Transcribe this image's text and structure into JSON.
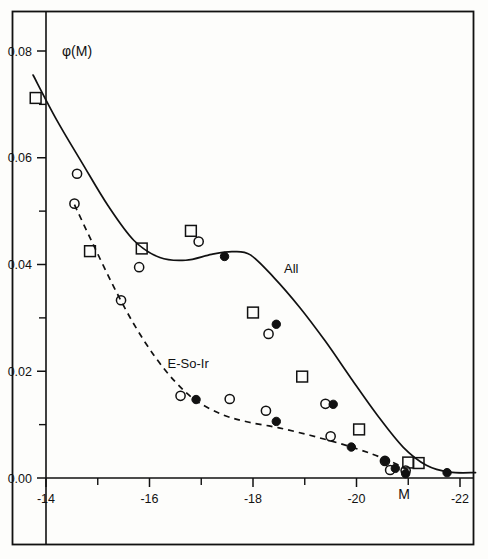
{
  "chart_data": {
    "type": "scatter",
    "title": "",
    "subtitle": "",
    "xlabel": "M",
    "ylabel": "φ(M)",
    "xlim": [
      -13.35,
      -22.35
    ],
    "ylim": [
      0.0,
      0.088
    ],
    "grid": false,
    "legend_position": "inline-annotations",
    "x_ticks_major": [
      "-14",
      "-16",
      "-18",
      "-20",
      "-22"
    ],
    "x_ticks_major_values": [
      -14,
      -16,
      -18,
      -20,
      -22
    ],
    "x_ticks_minor_values": [
      -15,
      -17,
      -19,
      -21
    ],
    "y_ticks_major": [
      "0.08",
      "0.06",
      "0.04",
      "0.02",
      "0.00"
    ],
    "y_ticks_major_values": [
      0.08,
      0.06,
      0.04,
      0.02,
      0.0
    ],
    "y_ticks_minor_values": [
      0.07,
      0.05,
      0.03,
      0.01
    ],
    "annotations": [
      {
        "text": "All",
        "x": -18.6,
        "y": 0.0385,
        "name": "curve-label-all"
      },
      {
        "text": "E-So-Ir",
        "x": -16.35,
        "y": 0.0207,
        "name": "curve-label-e-so-ir"
      }
    ],
    "series": [
      {
        "name": "All",
        "curve_style": "solid",
        "curve_points": [
          [
            -13.75,
            0.0755
          ],
          [
            -14.2,
            0.0672
          ],
          [
            -14.7,
            0.059
          ],
          [
            -15.2,
            0.051
          ],
          [
            -15.7,
            0.0445
          ],
          [
            -16.2,
            0.0413
          ],
          [
            -16.7,
            0.0408
          ],
          [
            -17.2,
            0.0419
          ],
          [
            -17.6,
            0.0424
          ],
          [
            -17.95,
            0.0418
          ],
          [
            -18.4,
            0.0376
          ],
          [
            -18.9,
            0.032
          ],
          [
            -19.4,
            0.0256
          ],
          [
            -19.9,
            0.0186
          ],
          [
            -20.4,
            0.0118
          ],
          [
            -20.9,
            0.0058
          ],
          [
            -21.35,
            0.0024
          ],
          [
            -21.8,
            0.0011
          ],
          [
            -22.3,
            0.001
          ]
        ],
        "points_open_square": [
          [
            -13.8,
            0.0712
          ],
          [
            -14.85,
            0.0425
          ],
          [
            -15.85,
            0.043
          ],
          [
            -16.8,
            0.0463
          ],
          [
            -18.0,
            0.031
          ],
          [
            -18.95,
            0.019
          ],
          [
            -20.05,
            0.0091
          ],
          [
            -21.0,
            0.0029
          ],
          [
            -21.2,
            0.0028
          ]
        ],
        "points_open_circle": [
          [
            -14.6,
            0.057
          ],
          [
            -14.55,
            0.0514
          ],
          [
            -15.8,
            0.0395
          ],
          [
            -16.95,
            0.0443
          ],
          [
            -18.3,
            0.027
          ],
          [
            -19.4,
            0.0139
          ],
          [
            -20.65,
            0.0015
          ]
        ],
        "points_filled_circle": [
          [
            -17.45,
            0.0415
          ],
          [
            -18.45,
            0.0288
          ],
          [
            -19.55,
            0.0138
          ],
          [
            -20.55,
            0.0032
          ],
          [
            -20.95,
            0.0008
          ],
          [
            -21.75,
            0.001
          ]
        ]
      },
      {
        "name": "E-So-Ir",
        "curve_style": "dashed",
        "curve_points": [
          [
            -14.55,
            0.0512
          ],
          [
            -14.9,
            0.044
          ],
          [
            -15.3,
            0.036
          ],
          [
            -15.7,
            0.0288
          ],
          [
            -16.1,
            0.0228
          ],
          [
            -16.5,
            0.018
          ],
          [
            -16.9,
            0.0145
          ],
          [
            -17.4,
            0.0119
          ],
          [
            -17.9,
            0.0105
          ],
          [
            -18.5,
            0.0094
          ],
          [
            -19.1,
            0.008
          ],
          [
            -19.7,
            0.0064
          ],
          [
            -20.3,
            0.0045
          ],
          [
            -20.8,
            0.0025
          ],
          [
            -21.05,
            0.0012
          ]
        ],
        "points_open_circle": [
          [
            -15.45,
            0.0333
          ],
          [
            -16.6,
            0.0154
          ],
          [
            -17.55,
            0.0148
          ],
          [
            -18.25,
            0.0126
          ],
          [
            -19.5,
            0.0078
          ],
          [
            -20.55,
            0.0032
          ],
          [
            -20.95,
            0.0014
          ]
        ],
        "points_filled_circle": [
          [
            -16.9,
            0.0147
          ],
          [
            -18.45,
            0.0106
          ],
          [
            -19.9,
            0.0058
          ],
          [
            -20.75,
            0.0018
          ]
        ]
      }
    ]
  },
  "figure": {
    "frame_color": "#111111",
    "background": "#fdfdfb"
  }
}
